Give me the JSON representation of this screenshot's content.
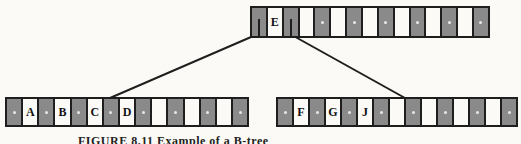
{
  "diagram": {
    "type": "B-tree node split illustration",
    "root": {
      "keys": [
        "E",
        "",
        "",
        "",
        "",
        "",
        ""
      ],
      "pointer_count": 8
    },
    "left_child": {
      "keys": [
        "A",
        "B",
        "C",
        "D",
        "",
        "",
        ""
      ],
      "pointer_count": 8
    },
    "right_child": {
      "keys": [
        "F",
        "G",
        "J",
        "",
        "",
        "",
        ""
      ],
      "pointer_count": 8
    },
    "edges": [
      {
        "from": "root.pointer.0",
        "to": "left_child"
      },
      {
        "from": "root.pointer.1",
        "to": "right_child"
      }
    ],
    "colors": {
      "pointer_cell": "#8a8a8a",
      "key_cell": "#fbfaf6",
      "border": "#1e1e1e"
    }
  },
  "caption": "FIGURE 8.11  Example of a B-tree"
}
